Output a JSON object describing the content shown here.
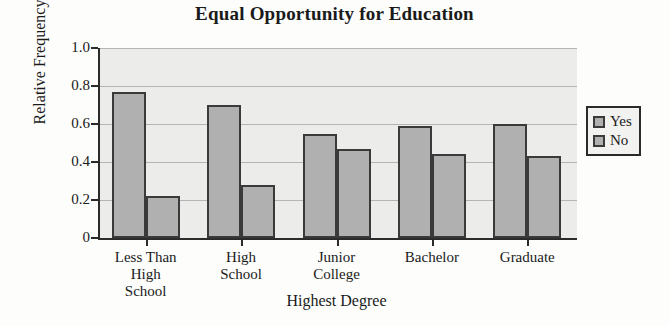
{
  "chart_data": {
    "type": "bar",
    "title": "Equal Opportunity for Education",
    "xlabel": "Highest Degree",
    "ylabel": "Relative Frequency",
    "categories": [
      "Less Than\nHigh\nSchool",
      "High\nSchool",
      "Junior\nCollege",
      "Bachelor",
      "Graduate"
    ],
    "series": [
      {
        "name": "Yes",
        "values": [
          0.77,
          0.7,
          0.55,
          0.59,
          0.6
        ]
      },
      {
        "name": "No",
        "values": [
          0.22,
          0.28,
          0.47,
          0.44,
          0.43
        ]
      }
    ],
    "ylim": [
      0,
      1.0
    ],
    "ytick_labels": [
      "0",
      "0.2",
      "0.4",
      "0.6",
      "0.8",
      "1.0"
    ],
    "ytick_values": [
      0,
      0.2,
      0.4,
      0.6,
      0.8,
      1.0
    ],
    "grid": true,
    "legend_position": "right",
    "colors": {
      "bar_fill": "#b0b0b0",
      "bar_edge": "#3a3a3a",
      "plot_background": "#ececeb",
      "gridline": "#b4b4b4",
      "axis": "#2b2b2b",
      "text": "#1a1a1a"
    }
  }
}
